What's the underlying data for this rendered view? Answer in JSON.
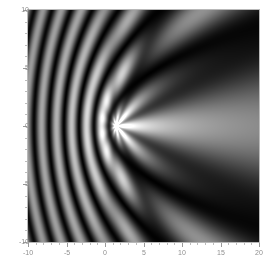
{
  "figure": {
    "type": "density-plot",
    "background_color": "#ffffff",
    "frame_color": "#b9b9b9",
    "tick_color": "#9a9a9a",
    "label_color": "#8f8f8f",
    "plot_background": "#000000"
  },
  "chart_data": {
    "type": "heatmap",
    "title": "",
    "subtitle": "",
    "xlabel": "",
    "ylabel": "",
    "xlim": [
      -10,
      20
    ],
    "ylim": [
      -10,
      10
    ],
    "grid": false,
    "legend": "none",
    "colormap": "grayscale",
    "colormap_low": "#000000",
    "colormap_high": "#ffffff",
    "xticks": [
      -10,
      -5,
      0,
      5,
      10,
      15,
      20
    ],
    "xtick_labels": [
      "-10",
      "-5",
      "0",
      "5",
      "10",
      "15",
      "20"
    ],
    "yticks": [
      -10,
      -5,
      0,
      5,
      10
    ],
    "ytick_labels": [
      "-10",
      "-5",
      "0",
      "5",
      "10"
    ],
    "x_minor_step": 1,
    "y_minor_step": 1,
    "focal_point": [
      1.5,
      0.0
    ],
    "field": {
      "model": "two-source-interference-with-caustic",
      "source_x": 1.5,
      "source_y": 0.0,
      "wave_number": 1.15,
      "ray_count": 9,
      "fringe_period": 3.9,
      "amplitude_max": 1.0,
      "amplitude_min": 0.0
    },
    "value_range": [
      0,
      1
    ],
    "sampled_values": {
      "comment": "Representative normalized intensities read off the plot at selected (x,y) coordinates.",
      "points": [
        {
          "x": 1.5,
          "y": 0.0,
          "v": 0.95
        },
        {
          "x": -8.0,
          "y": 0.0,
          "v": 0.05
        },
        {
          "x": -5.5,
          "y": 7.5,
          "v": 0.92
        },
        {
          "x": -5.5,
          "y": 2.5,
          "v": 0.95
        },
        {
          "x": -5.5,
          "y": -2.5,
          "v": 0.95
        },
        {
          "x": -5.5,
          "y": -7.5,
          "v": 0.92
        },
        {
          "x": -1.5,
          "y": 6.5,
          "v": 0.9
        },
        {
          "x": -1.5,
          "y": -6.5,
          "v": 0.9
        },
        {
          "x": 0.5,
          "y": 9.0,
          "v": 0.85
        },
        {
          "x": 3.5,
          "y": 3.5,
          "v": 0.8
        },
        {
          "x": 3.5,
          "y": -3.5,
          "v": 0.8
        },
        {
          "x": 9.5,
          "y": 3.5,
          "v": 0.95
        },
        {
          "x": 9.5,
          "y": -3.5,
          "v": 0.95
        },
        {
          "x": 14.0,
          "y": 5.0,
          "v": 0.95
        },
        {
          "x": 14.0,
          "y": -5.0,
          "v": 0.95
        },
        {
          "x": 19.0,
          "y": 6.0,
          "v": 0.93
        },
        {
          "x": 19.0,
          "y": -6.0,
          "v": 0.93
        },
        {
          "x": 12.0,
          "y": 0.0,
          "v": 0.04
        },
        {
          "x": 18.0,
          "y": 0.0,
          "v": 0.03
        },
        {
          "x": 6.0,
          "y": 9.0,
          "v": 0.1
        }
      ]
    }
  }
}
